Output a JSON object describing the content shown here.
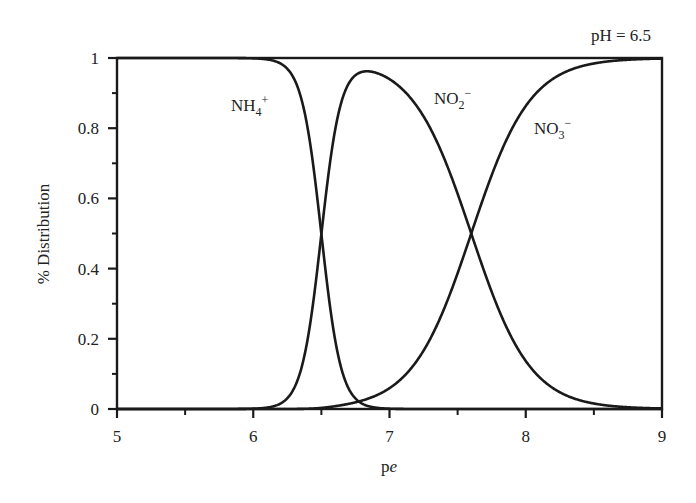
{
  "chart_data": {
    "type": "line",
    "title": "",
    "annotation": "pH = 6.5",
    "xlabel": "pe",
    "ylabel": "% Distribution",
    "xlim": [
      5,
      9
    ],
    "ylim": [
      0,
      1
    ],
    "xticks": [
      5,
      6,
      7,
      8,
      9
    ],
    "xtick_labels": [
      "5",
      "6",
      "7",
      "8",
      "9"
    ],
    "yticks": [
      0,
      0.2,
      0.4,
      0.6,
      0.8,
      1
    ],
    "ytick_labels": [
      "0",
      "0.2",
      "0.4",
      "0.6",
      "0.8",
      "1"
    ],
    "grid": false,
    "legend": "inline labels",
    "x": [
      5.0,
      6.0,
      6.2,
      6.3,
      6.4,
      6.5,
      6.6,
      6.7,
      6.8,
      6.9,
      7.0,
      7.2,
      7.4,
      7.6,
      7.8,
      8.0,
      8.2,
      8.5,
      9.0
    ],
    "series": [
      {
        "name": "NH4+",
        "label_main": "NH",
        "label_sub": "4",
        "label_sup": "+",
        "values": [
          1.0,
          0.999,
          0.985,
          0.941,
          0.799,
          0.499,
          0.2,
          0.059,
          0.016,
          0.004,
          0.001,
          0.0,
          0.0,
          0.0,
          0.0,
          0.0,
          0.0,
          0.0,
          0.0
        ]
      },
      {
        "name": "NO2-",
        "label_main": "NO",
        "label_sub": "2",
        "label_sup": "−",
        "values": [
          0.0,
          0.001,
          0.015,
          0.059,
          0.2,
          0.498,
          0.795,
          0.93,
          0.965,
          0.966,
          0.94,
          0.863,
          0.715,
          0.5,
          0.285,
          0.137,
          0.059,
          0.016,
          0.002
        ]
      },
      {
        "name": "NO3-",
        "label_main": "NO",
        "label_sub": "3",
        "label_sup": "−",
        "values": [
          0.0,
          0.0,
          0.0,
          0.0,
          0.001,
          0.003,
          0.005,
          0.012,
          0.019,
          0.03,
          0.059,
          0.137,
          0.285,
          0.5,
          0.715,
          0.863,
          0.941,
          0.984,
          0.998
        ]
      }
    ],
    "model": {
      "pe_half_NH4_NO2": 6.5,
      "electrons_NH4_NO2": 6,
      "pe_half_NO2_NO3": 7.6,
      "electrons_NO2_NO3": 2
    }
  }
}
